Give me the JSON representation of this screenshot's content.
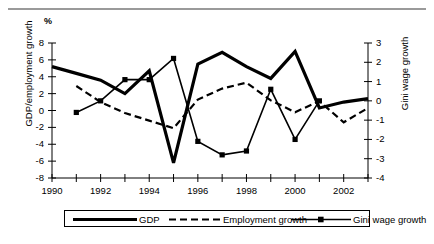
{
  "figure": {
    "unit_label": "%",
    "y_axis_left_title": "GDP/employment growth",
    "y_axis_right_title": "Gini wage growth"
  },
  "legend": {
    "items": [
      {
        "label": "GDP",
        "style": "thick-solid"
      },
      {
        "label": "Employment growth",
        "style": "dashed"
      },
      {
        "label": "Gini wage growth",
        "style": "thin-solid-square-marker"
      }
    ]
  },
  "chart_data": {
    "type": "line",
    "title": "",
    "subtitle": "",
    "xlabel": "",
    "ylabel": "GDP/employment growth",
    "y2label": "Gini wage growth",
    "unit": "%",
    "grid": false,
    "legend_position": "bottom",
    "x": [
      1990,
      1991,
      1992,
      1993,
      1994,
      1995,
      1996,
      1997,
      1998,
      1999,
      2000,
      2001,
      2002,
      2003
    ],
    "xlim": [
      1990,
      2003
    ],
    "xticks": [
      1990,
      1991,
      1992,
      1993,
      1994,
      1995,
      1996,
      1997,
      1998,
      1999,
      2000,
      2001,
      2002,
      2003
    ],
    "xticklabels": [
      "1990",
      "",
      "1992",
      "",
      "1994",
      "",
      "1996",
      "",
      "1998",
      "",
      "2000",
      "",
      "2002",
      ""
    ],
    "xticklabels_shown": [
      "1990",
      "1992",
      "1994",
      "1996",
      "1998",
      "2000",
      "2002"
    ],
    "ylim": [
      -8,
      8
    ],
    "yticks": [
      8,
      6,
      4,
      2,
      0,
      -2,
      -4,
      -6,
      -8
    ],
    "yticklabels": [
      "8",
      "6",
      "4",
      "2",
      "0",
      "-2",
      "-4",
      "-6",
      "-8"
    ],
    "y2lim": [
      -4,
      3
    ],
    "y2ticks": [
      3,
      2,
      1,
      0,
      -1,
      -2,
      -3,
      -4
    ],
    "y2ticklabels": [
      "3",
      "2",
      "1",
      "0",
      "-1",
      "-2",
      "-3",
      "-4"
    ],
    "series": [
      {
        "name": "GDP",
        "axis": "left",
        "x": [
          1990,
          1991,
          1992,
          1993,
          1994,
          1995,
          1996,
          1997,
          1998,
          1999,
          2000,
          2001,
          2002,
          2003
        ],
        "values": [
          5.2,
          4.4,
          3.6,
          2.0,
          4.7,
          -6.2,
          5.5,
          6.9,
          5.2,
          3.8,
          7.0,
          0.3,
          1.0,
          1.4
        ]
      },
      {
        "name": "Employment growth",
        "axis": "left",
        "x": [
          1991,
          1992,
          1993,
          1994,
          1995,
          1996,
          1997,
          1998,
          1999,
          2000,
          2001,
          2002,
          2003
        ],
        "values": [
          2.9,
          1.0,
          -0.3,
          -1.2,
          -2.1,
          1.3,
          2.6,
          3.3,
          1.2,
          -0.2,
          1.1,
          -1.4,
          0.3
        ]
      },
      {
        "name": "Gini wage growth",
        "axis": "right",
        "x": [
          1991,
          1992,
          1993,
          1994,
          1995,
          1996,
          1997,
          1998,
          1999,
          2000,
          2001
        ],
        "values": [
          -0.6,
          0.0,
          1.1,
          1.1,
          2.2,
          -2.1,
          -2.8,
          -2.6,
          0.6,
          -2.0,
          0.0
        ]
      }
    ]
  },
  "colors": {
    "axis": "#000000",
    "series_line": "#000000",
    "top_rule": "#9a9a9a",
    "background": "#ffffff"
  }
}
